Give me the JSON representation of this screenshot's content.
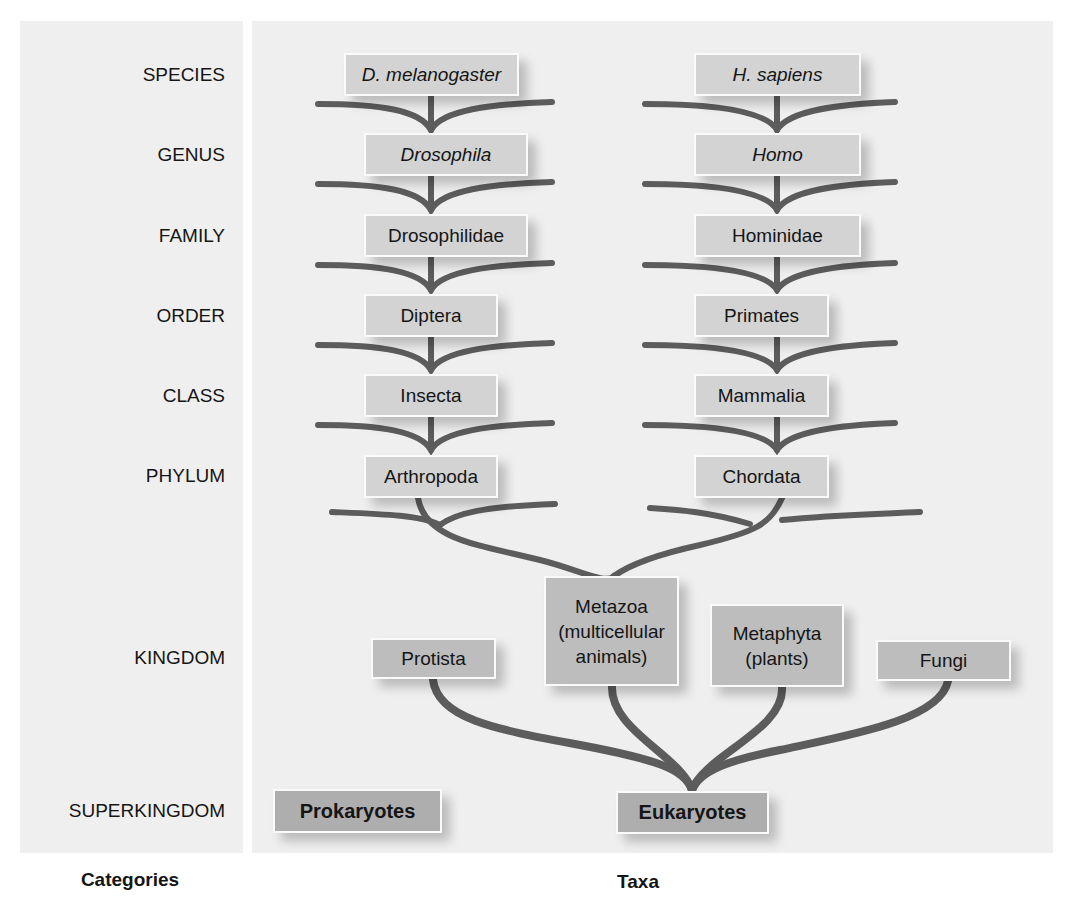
{
  "categories": {
    "heading": "Categories",
    "items": [
      {
        "label": "SPECIES",
        "y": 75
      },
      {
        "label": "GENUS",
        "y": 155
      },
      {
        "label": "FAMILY",
        "y": 236
      },
      {
        "label": "ORDER",
        "y": 316
      },
      {
        "label": "CLASS",
        "y": 396
      },
      {
        "label": "PHYLUM",
        "y": 476
      },
      {
        "label": "KINGDOM",
        "y": 658
      },
      {
        "label": "SUPERKINGDOM",
        "y": 811
      }
    ]
  },
  "taxa": {
    "heading": "Taxa",
    "insect_lineage": {
      "species": "D. melanogaster",
      "genus": "Drosophila",
      "family": "Drosophilidae",
      "order": "Diptera",
      "class": "Insecta",
      "phylum": "Arthropoda"
    },
    "human_lineage": {
      "species": "H. sapiens",
      "genus": "Homo",
      "family": "Hominidae",
      "order": "Primates",
      "class": "Mammalia",
      "phylum": "Chordata"
    },
    "kingdoms": {
      "protista": "Protista",
      "metazoa": "Metazoa (multicellular animals)",
      "metazoa_lines": [
        "Metazoa",
        "(multicellular",
        "animals)"
      ],
      "metaphyta_lines": [
        "Metaphyta",
        "(plants)"
      ],
      "fungi": "Fungi"
    },
    "superkingdoms": {
      "prokaryotes": "Prokaryotes",
      "eukaryotes": "Eukaryotes"
    }
  },
  "colors": {
    "panel_bg": "#efefef",
    "box_fill": "#d3d3d3",
    "box_fill_kingdom": "#bdbdbd",
    "box_fill_superkingdom": "#aeaeae",
    "branch": "#5c5c5c"
  }
}
